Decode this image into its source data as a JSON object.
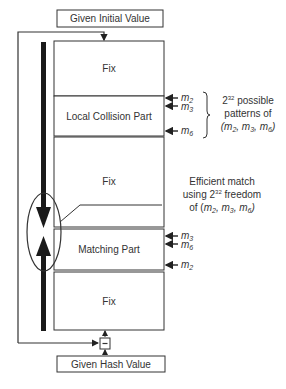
{
  "diagram": {
    "top_box": "Given Initial Value",
    "bottom_box": "Given Hash Value",
    "blocks": [
      {
        "label": "Fix"
      },
      {
        "label": "Local Collision Part"
      },
      {
        "label": "Fix"
      },
      {
        "label": "Matching Part"
      },
      {
        "label": "Fix"
      }
    ],
    "local_collision_inputs": [
      "m2",
      "m3",
      "m6"
    ],
    "matching_inputs": [
      "m3",
      "m6",
      "m2"
    ],
    "brace_note": {
      "line1": "2",
      "line1_sup": "32",
      "line1_rest": " possible",
      "line2": "patterns of",
      "line3": "(m2, m3, m6)"
    },
    "match_note": {
      "line1": "Efficient match",
      "line2_pre": "using 2",
      "line2_sup": "32",
      "line2_post": " freedom",
      "line3": "of (m2, m3, m6)"
    },
    "combine_symbol": "-",
    "colors": {
      "stroke": "#333333",
      "arrow": "#1a1a1a",
      "background": "#ffffff"
    }
  }
}
